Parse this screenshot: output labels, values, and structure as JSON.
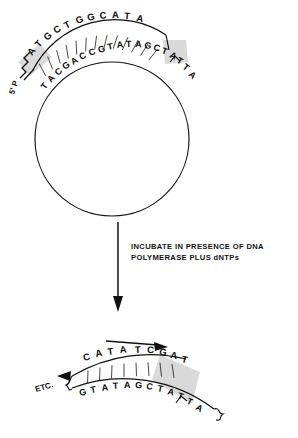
{
  "figure": {
    "panels": {
      "top": {
        "name": "circular-template-with-primer",
        "shape": "circle",
        "label_5p": "5' P",
        "top_strand_label": "primer-strand",
        "bottom_strand_label": "template-strand",
        "top_strand_sequence": "ATGCTGGCATA",
        "bottom_strand_sequence": "TACGACCGTATAGCTATTA",
        "top_strand_letters": [
          "A",
          "T",
          "G",
          "C",
          "T",
          "G",
          "G",
          "C",
          "A",
          "T",
          "A"
        ],
        "bottom_strand_letters": [
          "T",
          "A",
          "C",
          "G",
          "A",
          "C",
          "C",
          "G",
          "T",
          "A",
          "T",
          "A",
          "G",
          "C",
          "T",
          "A",
          "T",
          "T",
          "A"
        ],
        "highlight_color": "#d6d6d6"
      },
      "arrow": {
        "name": "process-arrow",
        "direction": "down"
      },
      "instruction": {
        "line1": "INCUBATE IN PRESENCE OF DNA",
        "line2": "POLYMERASE PLUS dNTPs"
      },
      "bottom": {
        "name": "extended-product",
        "etc_label": "ETC.",
        "synthesis_arrow_direction": "right",
        "top_strand_sequence": "CATA TCGAT",
        "top_strand_existing": "CATA",
        "top_strand_new": "TCGAT",
        "top_strand_letters": [
          "C",
          "A",
          "T",
          "A",
          "T",
          "C",
          "G",
          "A",
          "T"
        ],
        "bottom_strand_sequence": "GTATAGCTATTA",
        "bottom_strand_letters": [
          "G",
          "T",
          "A",
          "T",
          "A",
          "G",
          "C",
          "T",
          "A",
          "T",
          "T",
          "A"
        ],
        "highlight_color": "#d6d6d6"
      }
    },
    "colors": {
      "ink": "#111111",
      "highlight": "#d6d6d6",
      "background": "#ffffff"
    }
  }
}
